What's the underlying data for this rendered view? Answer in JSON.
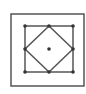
{
  "diagram": {
    "stroke_color": "#555555",
    "point_color": "#333333",
    "outer_frame": {
      "x": 11,
      "y": 14,
      "w": 73,
      "h": 72
    },
    "square": {
      "x": 25,
      "y": 26,
      "w": 48,
      "h": 46
    },
    "diamond": [
      [
        49,
        26
      ],
      [
        73,
        49
      ],
      [
        49,
        72
      ],
      [
        25,
        49
      ]
    ],
    "points": [
      [
        25,
        26
      ],
      [
        49,
        26
      ],
      [
        73,
        26
      ],
      [
        25,
        49
      ],
      [
        49,
        49
      ],
      [
        73,
        49
      ],
      [
        25,
        72
      ],
      [
        49,
        72
      ],
      [
        73,
        72
      ]
    ]
  }
}
